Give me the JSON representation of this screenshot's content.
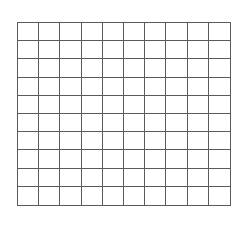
{
  "grid": {
    "rows": 10,
    "columns": 10,
    "line_color": "#5a5a5a",
    "background": "#ffffff",
    "filled_cells": []
  }
}
